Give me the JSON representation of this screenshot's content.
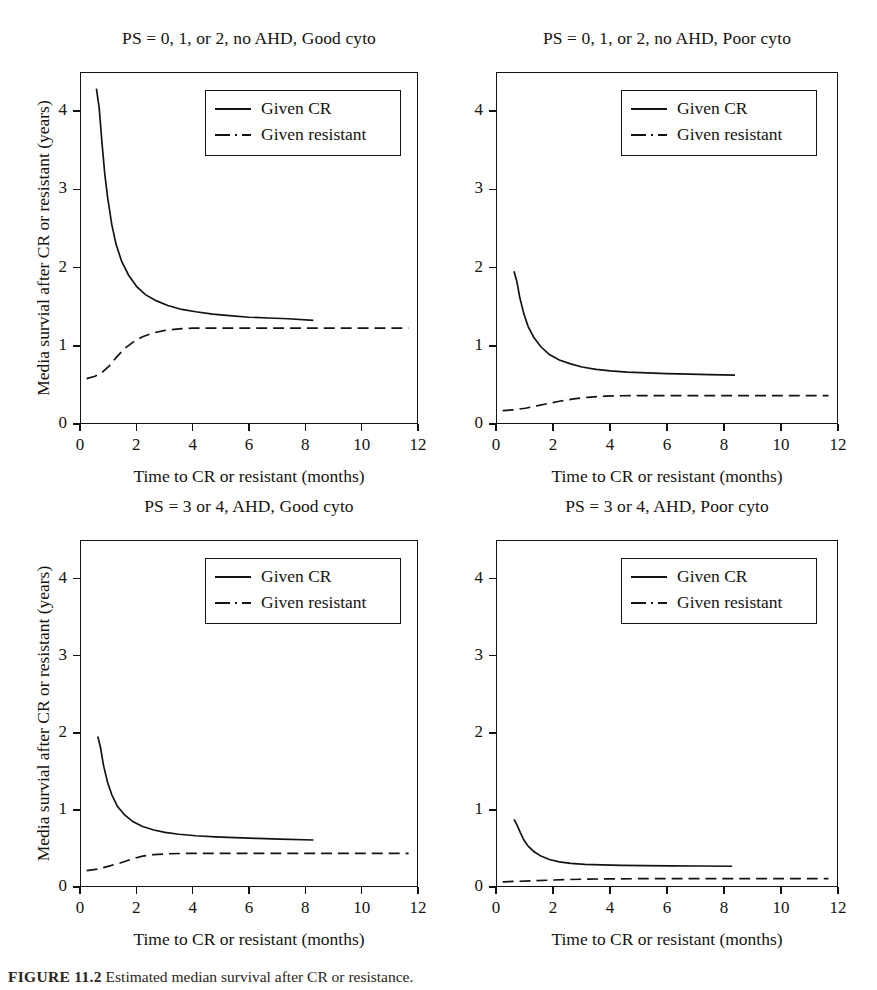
{
  "figure": {
    "caption_label": "FIGURE 11.2",
    "caption_text": "Estimated median survival after CR or resistance."
  },
  "axes": {
    "xlabel": "Time to CR or resistant (months)",
    "ylabel": "Media survial after CR or resistant (years)",
    "xticks": [
      "0",
      "2",
      "4",
      "6",
      "8",
      "10",
      "12"
    ],
    "yticks": [
      "0",
      "1",
      "2",
      "3",
      "4"
    ],
    "xlim": [
      0,
      12
    ],
    "ylim": [
      0,
      4.5
    ]
  },
  "legend": {
    "cr_label": "Given CR",
    "resistant_label": "Given resistant",
    "cr_style": "solid",
    "resistant_style": "dashed"
  },
  "colors": {
    "ink": "#16130e",
    "paper": "#ffffff"
  },
  "panels": [
    {
      "id": "top-left",
      "title": "PS = 0, 1, or 2, no AHD, Good cyto"
    },
    {
      "id": "top-right",
      "title": "PS = 0, 1, or 2, no AHD, Poor cyto"
    },
    {
      "id": "bottom-left",
      "title": "PS = 3 or 4, AHD, Good cyto"
    },
    {
      "id": "bottom-right",
      "title": "PS = 3 or 4, AHD, Poor cyto"
    }
  ],
  "chart_data": [
    {
      "type": "line",
      "panel": "top-left",
      "title": "PS = 0, 1, or 2, no AHD, Good cyto",
      "xlabel": "Time to CR or resistant (months)",
      "ylabel": "Media survial after CR or resistant (years)",
      "xlim": [
        0,
        12
      ],
      "ylim": [
        0,
        4.5
      ],
      "grid": false,
      "legend_position": "upper-center",
      "series": [
        {
          "name": "Given CR",
          "style": "solid",
          "x": [
            0.55,
            0.65,
            0.75,
            0.85,
            0.95,
            1.1,
            1.25,
            1.45,
            1.7,
            2.0,
            2.3,
            2.7,
            3.1,
            3.6,
            4.1,
            4.7,
            5.3,
            6.0,
            6.7,
            7.4,
            8.3
          ],
          "y": [
            4.3,
            4.05,
            3.6,
            3.2,
            2.9,
            2.55,
            2.3,
            2.08,
            1.9,
            1.75,
            1.65,
            1.57,
            1.51,
            1.46,
            1.43,
            1.4,
            1.38,
            1.36,
            1.35,
            1.34,
            1.32
          ]
        },
        {
          "name": "Given resistant",
          "style": "dashed",
          "x": [
            0.2,
            0.5,
            0.75,
            1.0,
            1.3,
            1.6,
            1.9,
            2.2,
            2.6,
            3.0,
            3.5,
            4.0,
            4.8,
            5.6,
            6.5,
            7.5,
            8.5,
            9.5,
            10.6,
            11.7
          ],
          "y": [
            0.57,
            0.6,
            0.65,
            0.73,
            0.86,
            0.97,
            1.05,
            1.11,
            1.16,
            1.19,
            1.21,
            1.22,
            1.22,
            1.22,
            1.22,
            1.22,
            1.22,
            1.22,
            1.22,
            1.22
          ]
        }
      ]
    },
    {
      "type": "line",
      "panel": "top-right",
      "title": "PS = 0, 1, or 2, no AHD, Poor cyto",
      "xlabel": "Time to CR or resistant (months)",
      "ylabel": "",
      "xlim": [
        0,
        12
      ],
      "ylim": [
        0,
        4.5
      ],
      "grid": false,
      "legend_position": "upper-center",
      "series": [
        {
          "name": "Given CR",
          "style": "solid",
          "x": [
            0.6,
            0.7,
            0.8,
            0.95,
            1.1,
            1.3,
            1.55,
            1.85,
            2.2,
            2.6,
            3.0,
            3.5,
            4.0,
            4.6,
            5.3,
            6.0,
            6.8,
            7.5,
            8.4
          ],
          "y": [
            1.95,
            1.82,
            1.62,
            1.4,
            1.24,
            1.1,
            0.98,
            0.88,
            0.81,
            0.76,
            0.72,
            0.69,
            0.67,
            0.655,
            0.645,
            0.635,
            0.628,
            0.622,
            0.615
          ]
        },
        {
          "name": "Given resistant",
          "style": "dashed",
          "x": [
            0.2,
            0.6,
            1.0,
            1.4,
            1.8,
            2.2,
            2.7,
            3.2,
            3.8,
            4.4,
            5.2,
            6.0,
            7.0,
            8.0,
            9.0,
            10.2,
            11.7
          ],
          "y": [
            0.16,
            0.17,
            0.19,
            0.22,
            0.25,
            0.28,
            0.31,
            0.33,
            0.345,
            0.35,
            0.352,
            0.352,
            0.352,
            0.352,
            0.352,
            0.352,
            0.352
          ]
        }
      ]
    },
    {
      "type": "line",
      "panel": "bottom-left",
      "title": "PS = 3 or 4, AHD, Good cyto",
      "xlabel": "Time to CR or resistant (months)",
      "ylabel": "Media survial after CR or resistant (years)",
      "xlim": [
        0,
        12
      ],
      "ylim": [
        0,
        4.5
      ],
      "grid": false,
      "legend_position": "upper-center",
      "series": [
        {
          "name": "Given CR",
          "style": "solid",
          "x": [
            0.6,
            0.7,
            0.8,
            0.95,
            1.1,
            1.3,
            1.55,
            1.85,
            2.2,
            2.6,
            3.0,
            3.5,
            4.1,
            4.8,
            5.5,
            6.3,
            7.1,
            8.3
          ],
          "y": [
            1.95,
            1.8,
            1.58,
            1.35,
            1.19,
            1.04,
            0.93,
            0.84,
            0.775,
            0.73,
            0.7,
            0.675,
            0.655,
            0.64,
            0.63,
            0.62,
            0.612,
            0.6
          ]
        },
        {
          "name": "Given resistant",
          "style": "dashed",
          "x": [
            0.2,
            0.6,
            1.0,
            1.4,
            1.8,
            2.2,
            2.6,
            3.1,
            3.7,
            4.4,
            5.2,
            6.2,
            7.2,
            8.4,
            9.6,
            10.7,
            11.7
          ],
          "y": [
            0.2,
            0.22,
            0.26,
            0.3,
            0.35,
            0.39,
            0.41,
            0.42,
            0.425,
            0.425,
            0.425,
            0.425,
            0.425,
            0.425,
            0.425,
            0.425,
            0.425
          ]
        }
      ]
    },
    {
      "type": "line",
      "panel": "bottom-right",
      "title": "PS = 3 or 4, AHD, Poor cyto",
      "xlabel": "Time to CR or resistant (months)",
      "ylabel": "",
      "xlim": [
        0,
        12
      ],
      "ylim": [
        0,
        4.5
      ],
      "grid": false,
      "legend_position": "upper-center",
      "series": [
        {
          "name": "Given CR",
          "style": "solid",
          "x": [
            0.6,
            0.7,
            0.82,
            0.95,
            1.1,
            1.3,
            1.55,
            1.85,
            2.2,
            2.6,
            3.1,
            3.7,
            4.4,
            5.2,
            6.1,
            7.1,
            8.3
          ],
          "y": [
            0.87,
            0.8,
            0.7,
            0.6,
            0.52,
            0.45,
            0.39,
            0.345,
            0.315,
            0.295,
            0.283,
            0.275,
            0.27,
            0.266,
            0.263,
            0.261,
            0.258
          ]
        },
        {
          "name": "Given resistant",
          "style": "dashed",
          "x": [
            0.2,
            0.8,
            1.4,
            2.0,
            2.6,
            3.2,
            4.0,
            4.8,
            5.8,
            6.8,
            8.0,
            9.2,
            10.4,
            11.7
          ],
          "y": [
            0.055,
            0.062,
            0.07,
            0.078,
            0.085,
            0.09,
            0.093,
            0.095,
            0.095,
            0.095,
            0.095,
            0.095,
            0.095,
            0.095
          ]
        }
      ]
    }
  ]
}
